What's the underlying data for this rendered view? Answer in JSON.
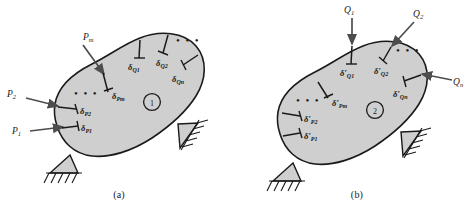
{
  "figure": {
    "type": "engineering-diagram",
    "background_color": "#ffffff",
    "body_fill_color": "#cfcfcf",
    "body_outline_color": "#1a1a1a",
    "panels": [
      {
        "id": "a",
        "caption": "(a)",
        "state_marker": "1",
        "loads": [
          {
            "name": "P-1",
            "label": "P",
            "sub": "1",
            "direction": "right"
          },
          {
            "name": "P-2",
            "label": "P",
            "sub": "2",
            "direction": "right"
          },
          {
            "name": "P-m",
            "label": "P",
            "sub": "m",
            "direction": "down-right"
          }
        ],
        "displacements": [
          {
            "name": "delta-P1",
            "symbol": "δ",
            "prime": "",
            "sub": "P1"
          },
          {
            "name": "delta-P2",
            "symbol": "δ",
            "prime": "",
            "sub": "P2"
          },
          {
            "name": "delta-Pm",
            "symbol": "δ",
            "prime": "",
            "sub": "Pm"
          },
          {
            "name": "delta-Q1",
            "symbol": "δ",
            "prime": "",
            "sub": "Q1"
          },
          {
            "name": "delta-Q2",
            "symbol": "δ",
            "prime": "",
            "sub": "Q2"
          },
          {
            "name": "delta-Qn",
            "symbol": "δ",
            "prime": "",
            "sub": "Qn"
          }
        ],
        "ellipsis": [
          "• • •",
          "• • •"
        ],
        "supports": [
          "pin-support-left",
          "pin-support-right"
        ]
      },
      {
        "id": "b",
        "caption": "(b)",
        "state_marker": "2",
        "loads": [
          {
            "name": "Q-1",
            "label": "Q",
            "sub": "1",
            "direction": "down"
          },
          {
            "name": "Q-2",
            "label": "Q",
            "sub": "2",
            "direction": "down-left"
          },
          {
            "name": "Q-n",
            "label": "Q",
            "sub": "n",
            "direction": "left"
          }
        ],
        "displacements": [
          {
            "name": "delta-prime-P1",
            "symbol": "δ",
            "prime": "′",
            "sub": "P1"
          },
          {
            "name": "delta-prime-P2",
            "symbol": "δ",
            "prime": "′",
            "sub": "P2"
          },
          {
            "name": "delta-prime-Pm",
            "symbol": "δ",
            "prime": "′",
            "sub": "Pm"
          },
          {
            "name": "delta-prime-Q1",
            "symbol": "δ",
            "prime": "′",
            "sub": "Q1"
          },
          {
            "name": "delta-prime-Q2",
            "symbol": "δ",
            "prime": "′",
            "sub": "Q2"
          },
          {
            "name": "delta-prime-Qn",
            "symbol": "δ",
            "prime": "′",
            "sub": "Qn"
          }
        ],
        "ellipsis": [
          "• • •",
          "• • •"
        ],
        "supports": [
          "pin-support-left",
          "pin-support-right"
        ]
      }
    ]
  }
}
